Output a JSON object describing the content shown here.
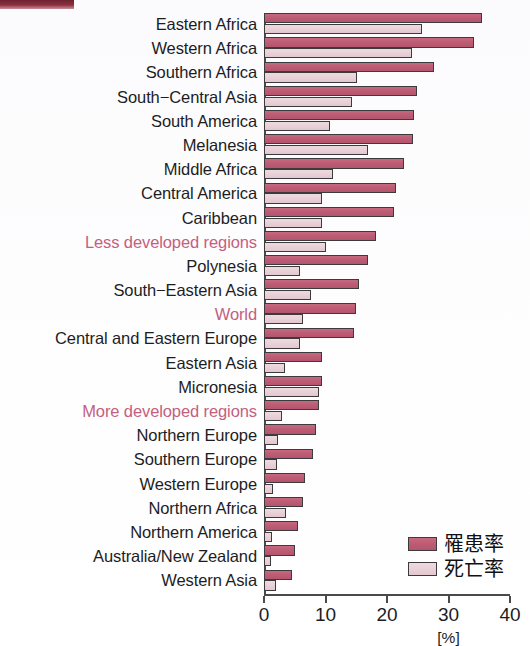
{
  "chart_data": {
    "type": "bar",
    "orientation": "horizontal",
    "title": "",
    "xlabel": "[%]",
    "ylabel": "",
    "xlim": [
      0,
      40
    ],
    "xticks": [
      0,
      10,
      20,
      30,
      40
    ],
    "xtick_labels": [
      "0",
      "10",
      "20",
      "30",
      "40"
    ],
    "grid": false,
    "legend_position": "bottom-right",
    "categories": [
      "Eastern Africa",
      "Western Africa",
      "Southern Africa",
      "South−Central Asia",
      "South America",
      "Melanesia",
      "Middle Africa",
      "Central America",
      "Caribbean",
      "Less developed regions",
      "Polynesia",
      "South−Eastern Asia",
      "World",
      "Central and Eastern Europe",
      "Eastern Asia",
      "Micronesia",
      "More developed regions",
      "Northern Europe",
      "Southern Europe",
      "Western Europe",
      "Northern Africa",
      "Northern America",
      "Australia/New Zealand",
      "Western Asia"
    ],
    "highlighted_categories": [
      "Less developed regions",
      "World",
      "More developed regions"
    ],
    "series": [
      {
        "name": "罹患率",
        "color": "#bd5d75",
        "values": [
          35.4,
          34.2,
          27.7,
          24.8,
          24.4,
          24.3,
          22.8,
          21.5,
          21.1,
          18.2,
          16.9,
          15.4,
          14.9,
          14.6,
          9.5,
          9.5,
          8.9,
          8.4,
          7.9,
          6.7,
          6.4,
          5.6,
          5.0,
          4.5
        ]
      },
      {
        "name": "死亡率",
        "color": "#e8cfd6",
        "values": [
          25.7,
          24.1,
          15.1,
          14.3,
          10.7,
          16.9,
          11.3,
          9.5,
          9.5,
          10.0,
          5.9,
          7.7,
          6.4,
          5.9,
          3.4,
          8.9,
          2.9,
          2.3,
          2.1,
          1.5,
          3.5,
          1.3,
          1.2,
          2.0
        ]
      }
    ]
  },
  "legend": {
    "items": [
      {
        "label": "罹患率",
        "swatch": "incidence"
      },
      {
        "label": "死亡率",
        "swatch": "mortality"
      }
    ]
  },
  "axis": {
    "unit_label": "[%]"
  },
  "colors": {
    "incidence": "#bd5d75",
    "mortality": "#e8cfd6",
    "highlight_text": "#c4607f",
    "text": "#1d1d1f",
    "axis": "#4a4a4c",
    "corner_mark": "#8d2f3f"
  }
}
